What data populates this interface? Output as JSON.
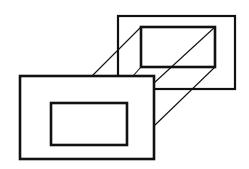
{
  "diagram": {
    "stroke_color": "#111111",
    "background": "#ffffff",
    "back_frame": {
      "outer": {
        "x": 118,
        "y": 16,
        "w": 117,
        "h": 73,
        "stroke": 2.2
      },
      "inner": {
        "x": 141,
        "y": 27,
        "w": 74,
        "h": 40,
        "stroke": 2.6
      }
    },
    "front_frame": {
      "outer": {
        "x": 20,
        "y": 76,
        "w": 134,
        "h": 83,
        "stroke": 2.6
      },
      "inner": {
        "x": 51,
        "y": 103,
        "w": 76,
        "h": 42,
        "stroke": 2.6
      }
    },
    "connectors": [
      {
        "x1": 141,
        "y1": 27,
        "x2": 92,
        "y2": 76
      },
      {
        "x1": 141,
        "y1": 67,
        "x2": 133,
        "y2": 76
      },
      {
        "x1": 215,
        "y1": 27,
        "x2": 154,
        "y2": 83
      },
      {
        "x1": 215,
        "y1": 67,
        "x2": 154,
        "y2": 126
      }
    ]
  }
}
